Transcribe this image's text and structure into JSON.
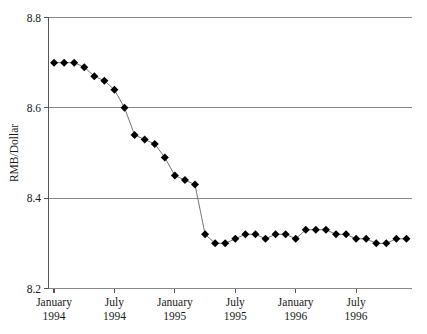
{
  "chart_data": {
    "type": "line",
    "title": "",
    "subtitle": "",
    "xlabel": "",
    "ylabel": "RMB/Dollar",
    "ylim": [
      8.2,
      8.8
    ],
    "ytick_labels": [
      "8.8",
      "8.6",
      "8.4",
      "8.2"
    ],
    "ytick_values": [
      8.8,
      8.6,
      8.4,
      8.2
    ],
    "xtick_labels": [
      {
        "month": "January",
        "year": "1994"
      },
      {
        "month": "July",
        "year": "1994"
      },
      {
        "month": "January",
        "year": "1995"
      },
      {
        "month": "July",
        "year": "1995"
      },
      {
        "month": "January",
        "year": "1996"
      },
      {
        "month": "July",
        "year": "1996"
      }
    ],
    "xtick_index": [
      0,
      6,
      12,
      18,
      24,
      30
    ],
    "grid": true,
    "grid_axis": "y",
    "legend": "none",
    "marker": "filled-diamond",
    "marker_color": "#000000",
    "line_color": "#555555",
    "x": [
      "1994-01",
      "1994-02",
      "1994-03",
      "1994-04",
      "1994-05",
      "1994-06",
      "1994-07",
      "1994-08",
      "1994-09",
      "1994-10",
      "1994-11",
      "1994-12",
      "1995-01",
      "1995-02",
      "1995-03",
      "1995-04",
      "1995-05",
      "1995-06",
      "1995-07",
      "1995-08",
      "1995-09",
      "1995-10",
      "1995-11",
      "1995-12",
      "1996-01",
      "1996-02",
      "1996-03",
      "1996-04",
      "1996-05",
      "1996-06",
      "1996-07",
      "1996-08",
      "1996-09",
      "1996-10",
      "1996-11",
      "1996-12"
    ],
    "values": [
      8.7,
      8.7,
      8.7,
      8.69,
      8.67,
      8.66,
      8.64,
      8.6,
      8.54,
      8.53,
      8.52,
      8.49,
      8.45,
      8.44,
      8.43,
      8.32,
      8.3,
      8.3,
      8.31,
      8.32,
      8.32,
      8.31,
      8.32,
      8.32,
      8.31,
      8.33,
      8.33,
      8.33,
      8.32,
      8.32,
      8.31,
      8.31,
      8.3,
      8.3,
      8.31,
      8.31
    ],
    "series": [
      {
        "name": "RMB/Dollar",
        "values": [
          8.7,
          8.7,
          8.7,
          8.69,
          8.67,
          8.66,
          8.64,
          8.6,
          8.54,
          8.53,
          8.52,
          8.49,
          8.45,
          8.44,
          8.43,
          8.32,
          8.3,
          8.3,
          8.31,
          8.32,
          8.32,
          8.31,
          8.32,
          8.32,
          8.31,
          8.33,
          8.33,
          8.33,
          8.32,
          8.32,
          8.31,
          8.31,
          8.3,
          8.3,
          8.31,
          8.31
        ]
      }
    ]
  },
  "colors": {
    "grid": "#888888",
    "axis": "#555555",
    "marker": "#000000",
    "line": "#666666",
    "text": "#1a1a1a",
    "background": "#ffffff"
  }
}
